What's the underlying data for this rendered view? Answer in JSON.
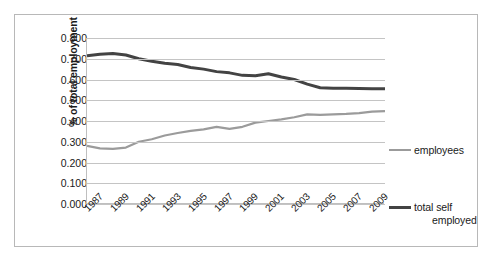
{
  "chart_data": {
    "type": "line",
    "title": "",
    "subtitle": "",
    "xlabel": "",
    "ylabel": "% of total employment",
    "ylim": [
      0.0,
      0.8
    ],
    "ytick_labels": [
      "0.800",
      "0.700",
      "0.600",
      "0.500",
      "0.400",
      "0.300",
      "0.200",
      "0.100",
      "0.000"
    ],
    "ytick_values": [
      0.8,
      0.7,
      0.6,
      0.5,
      0.4,
      0.3,
      0.2,
      0.1,
      0.0
    ],
    "grid": true,
    "legend_position": "right",
    "x": [
      1987,
      1988,
      1989,
      1990,
      1991,
      1992,
      1993,
      1994,
      1995,
      1996,
      1997,
      1998,
      1999,
      2000,
      2001,
      2002,
      2003,
      2004,
      2005,
      2006,
      2007,
      2008,
      2009,
      2010
    ],
    "xtick_labels": [
      "1987",
      "1989",
      "1991",
      "1993",
      "1995",
      "1997",
      "1999",
      "2001",
      "2003",
      "2005",
      "2007",
      "2009"
    ],
    "xtick_values": [
      1987,
      1989,
      1991,
      1993,
      1995,
      1997,
      1999,
      2001,
      2003,
      2005,
      2007,
      2009
    ],
    "series": [
      {
        "name": "employees",
        "color": "#9b9b9b",
        "width": 2.2,
        "values": [
          0.28,
          0.268,
          0.266,
          0.272,
          0.3,
          0.312,
          0.33,
          0.342,
          0.352,
          0.36,
          0.372,
          0.362,
          0.372,
          0.392,
          0.4,
          0.408,
          0.418,
          0.432,
          0.43,
          0.432,
          0.434,
          0.438,
          0.445,
          0.448
        ]
      },
      {
        "name": "total self employed",
        "color": "#434343",
        "width": 3.0,
        "values": [
          0.715,
          0.722,
          0.725,
          0.718,
          0.7,
          0.688,
          0.678,
          0.672,
          0.658,
          0.65,
          0.638,
          0.632,
          0.62,
          0.618,
          0.628,
          0.612,
          0.6,
          0.578,
          0.56,
          0.558,
          0.558,
          0.557,
          0.556,
          0.555
        ]
      }
    ]
  },
  "legend": {
    "items": [
      {
        "label": "employees",
        "label_line2": ""
      },
      {
        "label": "total self",
        "label_line2": "employed"
      }
    ]
  },
  "colors": {
    "employees": "#9b9b9b",
    "total_self_employed": "#434343",
    "gridline": "#c4c4c4",
    "axis": "#bfbfbf",
    "frame": "#b8b8b8",
    "text": "#1a1a1a"
  }
}
